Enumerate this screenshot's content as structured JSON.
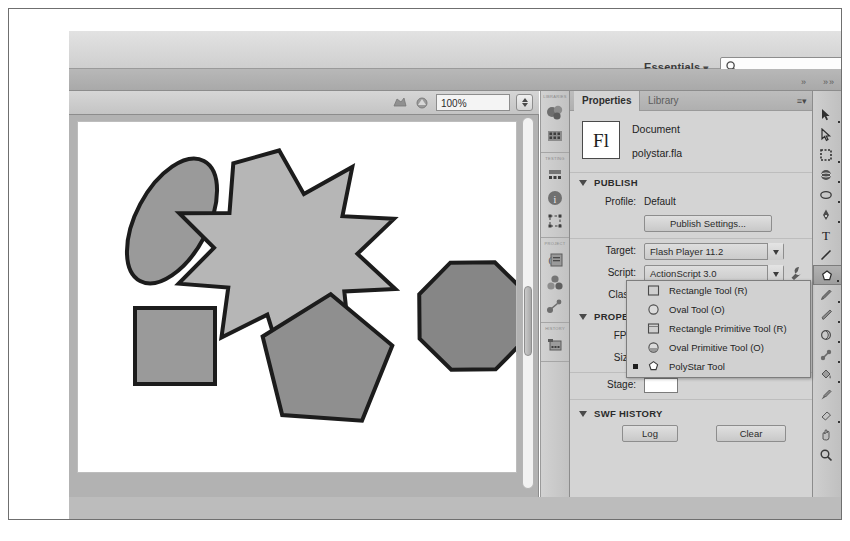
{
  "app": {
    "name": "Adobe Flash Professional",
    "workspace": "Essentials",
    "workspace_caret": "▾"
  },
  "search": {
    "placeholder": "",
    "value": "",
    "icon": "search-icon"
  },
  "stage_toolbar": {
    "zoom_value": "100%",
    "icon_left": "edit-scene-icon",
    "icon_right": "edit-symbol-icon",
    "stepper": "zoom-stepper"
  },
  "panel_dock": {
    "groups": [
      {
        "label": "LIBRARIES",
        "icons": [
          "color-icon",
          "swatches-icon"
        ]
      },
      {
        "label": "TESTING",
        "icons": [
          "align-icon",
          "info-icon",
          "transform-icon"
        ]
      },
      {
        "label": "PROJECT",
        "icons": [
          "code-snippets-icon",
          "components-icon",
          "motion-presets-icon"
        ]
      },
      {
        "label": "HISTORY",
        "icons": [
          "movie-explorer-icon"
        ]
      }
    ]
  },
  "properties": {
    "tabs": [
      {
        "label": "Properties",
        "active": true
      },
      {
        "label": "Library",
        "active": false
      }
    ],
    "menu_icon": "panel-menu-icon",
    "document": {
      "icon_text": "Fl",
      "type_label": "Document",
      "file_name": "polystar.fla"
    },
    "publish": {
      "header": "PUBLISH",
      "profile_label": "Profile:",
      "profile_value": "Default",
      "publish_settings_button": "Publish Settings...",
      "target_label": "Target:",
      "target_value": "Flash Player 11.2",
      "script_label": "Script:",
      "script_value": "ActionScript 3.0",
      "wrench_icon": "wrench-icon",
      "class_label": "Class:"
    },
    "properties_section": {
      "header": "PROPERTIES",
      "fps_label": "FPS:",
      "size_label": "Size:",
      "stage_label": "Stage:"
    },
    "swf_history": {
      "header": "SWF HISTORY",
      "log_button": "Log",
      "clear_button": "Clear"
    }
  },
  "tool_flyout": {
    "items": [
      {
        "label": "Rectangle Tool (R)",
        "icon": "rectangle-tool-icon",
        "selected": false
      },
      {
        "label": "Oval Tool (O)",
        "icon": "oval-tool-icon",
        "selected": false
      },
      {
        "label": "Rectangle Primitive Tool (R)",
        "icon": "rectangle-primitive-tool-icon",
        "selected": false
      },
      {
        "label": "Oval Primitive Tool (O)",
        "icon": "oval-primitive-tool-icon",
        "selected": false
      },
      {
        "label": "PolyStar Tool",
        "icon": "polystar-tool-icon",
        "selected": true
      }
    ]
  },
  "tools_panel": {
    "items": [
      {
        "name": "selection-tool",
        "selected": false
      },
      {
        "name": "subselection-tool",
        "selected": false
      },
      {
        "name": "lasso-tool",
        "selected": false
      },
      {
        "name": "3d-rotation-tool",
        "selected": false
      },
      {
        "name": "free-transform-tool",
        "selected": false
      },
      {
        "name": "pen-tool",
        "selected": false
      },
      {
        "name": "text-tool",
        "selected": false
      },
      {
        "name": "line-tool",
        "selected": false
      },
      {
        "name": "shape-tool",
        "selected": true
      },
      {
        "name": "pencil-tool",
        "selected": false
      },
      {
        "name": "brush-tool",
        "selected": false
      },
      {
        "name": "deco-tool",
        "selected": false
      },
      {
        "name": "bone-tool",
        "selected": false
      },
      {
        "name": "paint-bucket-tool",
        "selected": false
      },
      {
        "name": "eyedropper-tool",
        "selected": false
      },
      {
        "name": "eraser-tool",
        "selected": false
      },
      {
        "name": "hand-tool",
        "selected": false
      },
      {
        "name": "zoom-tool",
        "selected": false
      }
    ]
  },
  "canvas": {
    "background": "#ffffff",
    "shapes": [
      {
        "name": "ellipse",
        "fill": "#9a9a9a",
        "stroke": "#1c1c1c",
        "cx": 94,
        "cy": 99,
        "rx": 36,
        "ry": 68,
        "rotation": 28
      },
      {
        "name": "star-7-point",
        "fill": "#b6b6b6",
        "stroke": "#1c1c1c",
        "cx": 210,
        "cy": 100,
        "outer_r": 72,
        "inner_r": 31,
        "points": 7,
        "rotation": -8
      },
      {
        "name": "octagon",
        "fill": "#868686",
        "stroke": "#1c1c1c",
        "cx": 395,
        "cy": 194,
        "r": 58,
        "sides": 8,
        "rotation": 22
      },
      {
        "name": "square",
        "fill": "#9a9a9a",
        "stroke": "#1c1c1c",
        "x": 57,
        "y": 186,
        "w": 80,
        "h": 76
      },
      {
        "name": "pentagon",
        "fill": "#8f8f8f",
        "stroke": "#1c1c1c",
        "cx": 248,
        "cy": 240,
        "r": 68,
        "sides": 5,
        "rotation": 5
      }
    ]
  }
}
